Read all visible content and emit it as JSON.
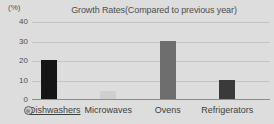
{
  "chart_data": {
    "type": "bar",
    "title": "Growth Rates(Compared to previous year)",
    "xlabel": "",
    "ylabel": "(%)",
    "unit_label": "(%)",
    "categories": [
      "Dishwashers",
      "Microwaves",
      "Ovens",
      "Refrigerators"
    ],
    "values": [
      20,
      4,
      30,
      10
    ],
    "bar_colors": [
      "#151515",
      "#cfcfcf",
      "#6e6e6e",
      "#3a3a3a"
    ],
    "ylim": [
      0,
      40
    ],
    "yticks": [
      0,
      10,
      20,
      30,
      40
    ],
    "ytick_labels": [
      "0",
      "10",
      "20",
      "30",
      "40"
    ],
    "grid": true,
    "legend": "none"
  },
  "axis": {
    "unit": "(%)",
    "ticks": [
      {
        "label": "40",
        "value": 40
      },
      {
        "label": "30",
        "value": 30
      },
      {
        "label": "20",
        "value": 20
      },
      {
        "label": "10",
        "value": 10
      },
      {
        "label": "0",
        "value": 0
      }
    ]
  },
  "categories": [
    {
      "label": "Dishwashers",
      "value": 20,
      "color": "#151515",
      "selected": true,
      "icon": "cursor-target-icon"
    },
    {
      "label": "Microwaves",
      "value": 4,
      "color": "#cfcfcf",
      "selected": false,
      "icon": null
    },
    {
      "label": "Ovens",
      "value": 30,
      "color": "#6e6e6e",
      "selected": false,
      "icon": null
    },
    {
      "label": "Refrigerators",
      "value": 10,
      "color": "#3a3a3a",
      "selected": false,
      "icon": null
    }
  ],
  "colors": {
    "background": "#dddddd",
    "gridline": "#c4c4c4",
    "axis": "#8d8d8d",
    "title_text": "#4e4e4e",
    "tick_text": "#4f4f4f",
    "label_text": "#3f3f3f"
  }
}
